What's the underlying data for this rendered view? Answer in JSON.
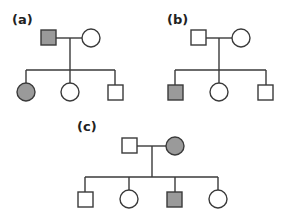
{
  "colors": {
    "affected": "#9a9a9a",
    "unaffected": "#ffffff",
    "line": "#3a3a3a"
  },
  "legend_note": "Square = male, circle = female, shaded = affected",
  "pedigrees": [
    {
      "label": "(a)",
      "parents": [
        {
          "sex": "male",
          "affected": true
        },
        {
          "sex": "female",
          "affected": false
        }
      ],
      "children": [
        {
          "sex": "female",
          "affected": true
        },
        {
          "sex": "female",
          "affected": false
        },
        {
          "sex": "male",
          "affected": false
        }
      ]
    },
    {
      "label": "(b)",
      "parents": [
        {
          "sex": "male",
          "affected": false
        },
        {
          "sex": "female",
          "affected": false
        }
      ],
      "children": [
        {
          "sex": "male",
          "affected": true
        },
        {
          "sex": "female",
          "affected": false
        },
        {
          "sex": "male",
          "affected": false
        }
      ]
    },
    {
      "label": "(c)",
      "parents": [
        {
          "sex": "male",
          "affected": false
        },
        {
          "sex": "female",
          "affected": true
        }
      ],
      "children": [
        {
          "sex": "male",
          "affected": false
        },
        {
          "sex": "female",
          "affected": false
        },
        {
          "sex": "male",
          "affected": true
        },
        {
          "sex": "female",
          "affected": false
        }
      ]
    }
  ]
}
